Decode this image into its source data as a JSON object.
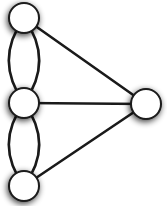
{
  "diagram": {
    "type": "multigraph",
    "colors": {
      "background": "#ffffff",
      "node_fill": "#ffffff",
      "stroke": "#1a1a1a",
      "shadow": "#555555"
    },
    "node_radius": 15,
    "nodes": [
      {
        "id": "top",
        "x": 24,
        "y": 18
      },
      {
        "id": "middle",
        "x": 24,
        "y": 103
      },
      {
        "id": "bottom",
        "x": 24,
        "y": 186
      },
      {
        "id": "right",
        "x": 146,
        "y": 104
      }
    ],
    "edges": [
      {
        "from": "top",
        "to": "middle",
        "curve": -16
      },
      {
        "from": "top",
        "to": "middle",
        "curve": 16
      },
      {
        "from": "middle",
        "to": "bottom",
        "curve": -16
      },
      {
        "from": "middle",
        "to": "bottom",
        "curve": 16
      },
      {
        "from": "top",
        "to": "right",
        "curve": 0
      },
      {
        "from": "middle",
        "to": "right",
        "curve": 0
      },
      {
        "from": "bottom",
        "to": "right",
        "curve": 0
      }
    ]
  }
}
